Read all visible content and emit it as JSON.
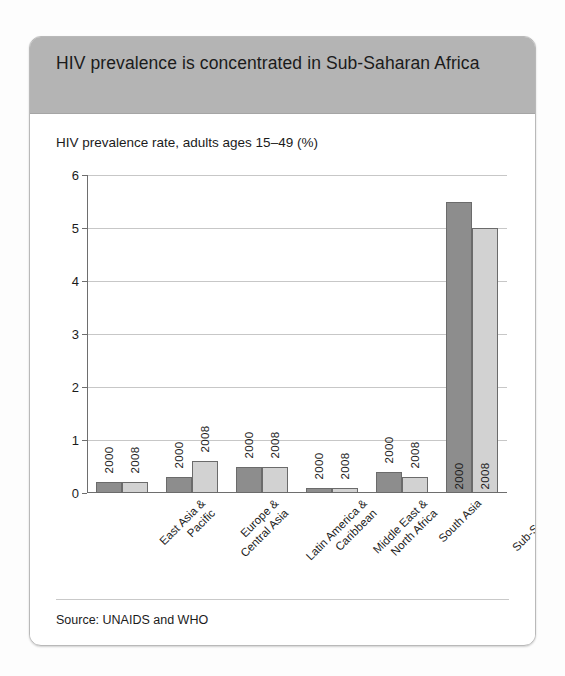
{
  "card": {
    "title": "HIV prevalence is concentrated in Sub-Saharan Africa",
    "subtitle": "HIV prevalence rate, adults ages 15–49 (%)",
    "source": "Source: UNAIDS and WHO",
    "header_color": "#b4b4b4",
    "series_colors": {
      "y2000": "#8d8d8d",
      "y2008": "#d2d2d2"
    }
  },
  "chart_data": {
    "type": "bar",
    "title": "HIV prevalence is concentrated in Sub-Saharan Africa",
    "subtitle": "HIV prevalence rate, adults ages 15–49 (%)",
    "xlabel": "",
    "ylabel": "HIV prevalence rate, adults ages 15–49 (%)",
    "ylim": [
      0,
      6
    ],
    "yticks": [
      0,
      1,
      2,
      3,
      4,
      5,
      6
    ],
    "ytick_labels": [
      "0",
      "1",
      "2",
      "3",
      "4",
      "5",
      "6"
    ],
    "grid": true,
    "legend": "none",
    "bar_annotations": "year labels drawn vertically beside each bar",
    "categories": [
      "East Asia & Pacific",
      "Europe & Central Asia",
      "Latin America & Caribbean",
      "Middle East & North Africa",
      "South Asia",
      "Sub-Saharan Africa"
    ],
    "category_lines": [
      [
        "East Asia &",
        "Pacific"
      ],
      [
        "Europe &",
        "Central Asia"
      ],
      [
        "Latin America &",
        "Caribbean"
      ],
      [
        "Middle East &",
        "North Africa"
      ],
      [
        "South Asia",
        ""
      ],
      [
        "Sub-Saharan",
        "Africa"
      ]
    ],
    "series": [
      {
        "name": "2000",
        "values": [
          0.2,
          0.3,
          0.5,
          0.1,
          0.4,
          5.5
        ]
      },
      {
        "name": "2008",
        "values": [
          0.2,
          0.6,
          0.5,
          0.1,
          0.3,
          5.0
        ]
      }
    ]
  }
}
